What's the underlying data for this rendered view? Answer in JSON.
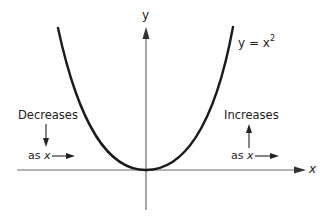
{
  "diagram": {
    "type": "function-graph",
    "axes": {
      "x_label": "x",
      "y_label": "y"
    },
    "curve": {
      "equation_lhs": "y = x",
      "equation_exp": "2",
      "description": "parabola y = x^2 with vertex at origin"
    },
    "annotations": {
      "left": {
        "title": "Decreases",
        "subtitle_prefix": "as ",
        "subtitle_var": "x",
        "arrow_direction": "down"
      },
      "right": {
        "title": "Increases",
        "subtitle_prefix": "as ",
        "subtitle_var": "x",
        "arrow_direction": "up"
      }
    },
    "colors": {
      "curve": "#1a1a1a",
      "axes": "#555555",
      "text": "#222222"
    }
  }
}
